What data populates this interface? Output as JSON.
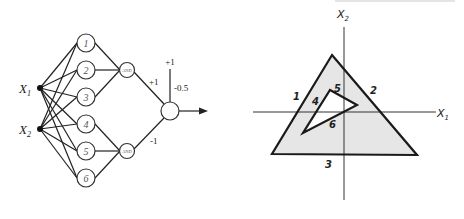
{
  "network": {
    "inputs": [
      {
        "label": "X",
        "sub": "1"
      },
      {
        "label": "X",
        "sub": "2"
      }
    ],
    "hidden_units": [
      "1",
      "2",
      "3",
      "4",
      "5",
      "6"
    ],
    "and_units": [
      "AND",
      "AND"
    ],
    "weights": {
      "upper": "+1",
      "lower": "-1",
      "bias_input": "+1",
      "bias_weight": "-0.5"
    }
  },
  "plot": {
    "x_axis": {
      "label": "X",
      "sub": "1"
    },
    "y_axis": {
      "label": "X",
      "sub": "2"
    },
    "region_labels": [
      "1",
      "2",
      "3",
      "4",
      "5",
      "6"
    ],
    "fill_color": "#e6e6e6",
    "stroke_color": "#222222"
  }
}
